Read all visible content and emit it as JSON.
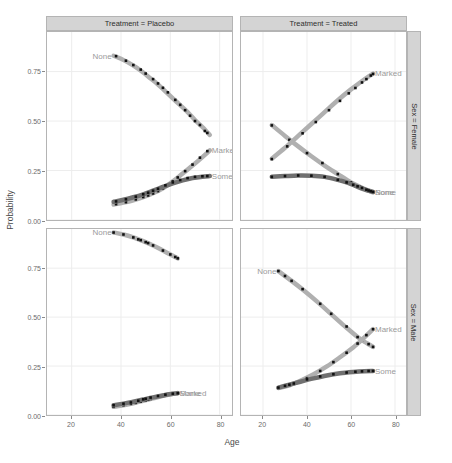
{
  "chart_data": {
    "type": "line",
    "title": "",
    "xlabel": "Age",
    "ylabel": "Probability",
    "xlim": [
      10,
      85
    ],
    "ylim": [
      0.0,
      0.95
    ],
    "grid": true,
    "legend_position": "inline-labels",
    "facet_rows": [
      "Sex = Female",
      "Sex = Male"
    ],
    "facet_cols": [
      "Treatment = Placebo",
      "Treatment = Treated"
    ],
    "xticks": [
      20,
      40,
      60,
      80
    ],
    "xtick_labels": [
      "20",
      "40",
      "60",
      "80"
    ],
    "yticks": [
      0.0,
      0.25,
      0.5,
      0.75
    ],
    "ytick_labels": [
      "0.00",
      "0.25",
      "0.50",
      "0.75"
    ],
    "colors": {
      "none": "#b0b0b0",
      "marked": "#b0b0b0",
      "some": "#707070",
      "point": "#111111",
      "panel_border": "#b4b4b4",
      "strip_fill": "#d4d4d4",
      "grid": "#ededed",
      "label_text": "#9a9a9a"
    },
    "panels": [
      {
        "id": "female-placebo",
        "col_label": "Treatment = Placebo",
        "row_label": "Sex = Female",
        "series": [
          {
            "name": "None",
            "color": "none",
            "label_anchor": "start",
            "x": [
              37,
              40,
              43,
              46,
              49,
              52,
              55,
              58,
              61,
              64,
              67,
              70,
              73,
              76
            ],
            "y": [
              0.83,
              0.815,
              0.795,
              0.772,
              0.745,
              0.715,
              0.685,
              0.65,
              0.615,
              0.58,
              0.545,
              0.505,
              0.47,
              0.43
            ],
            "points_x": [
              38,
              42,
              45,
              48,
              50,
              53,
              55,
              57,
              59,
              62,
              64,
              66,
              68,
              70,
              72,
              74,
              75
            ],
            "points_y": [
              0.828,
              0.805,
              0.783,
              0.76,
              0.74,
              0.712,
              0.69,
              0.668,
              0.645,
              0.607,
              0.582,
              0.555,
              0.527,
              0.5,
              0.48,
              0.45,
              0.44
            ]
          },
          {
            "name": "Marked",
            "color": "marked",
            "label_anchor": "end",
            "x": [
              37,
              41,
              45,
              49,
              53,
              57,
              61,
              65,
              69,
              73,
              76
            ],
            "y": [
              0.078,
              0.088,
              0.1,
              0.115,
              0.135,
              0.16,
              0.195,
              0.235,
              0.275,
              0.318,
              0.352
            ],
            "points_x": [
              38,
              42,
              46,
              49,
              51,
              53,
              55,
              57,
              59,
              61,
              63,
              66,
              69,
              72,
              75
            ],
            "points_y": [
              0.08,
              0.09,
              0.104,
              0.116,
              0.124,
              0.134,
              0.146,
              0.16,
              0.175,
              0.195,
              0.215,
              0.247,
              0.28,
              0.315,
              0.348
            ]
          },
          {
            "name": "Some",
            "color": "some",
            "label_anchor": "end",
            "x": [
              37,
              41,
              45,
              49,
              53,
              57,
              61,
              65,
              69,
              73,
              76
            ],
            "y": [
              0.092,
              0.102,
              0.115,
              0.13,
              0.148,
              0.167,
              0.185,
              0.2,
              0.212,
              0.219,
              0.222
            ],
            "points_x": [
              38,
              42,
              46,
              49,
              51,
              53,
              55,
              58,
              61,
              64,
              67,
              70,
              73,
              75
            ],
            "points_y": [
              0.094,
              0.105,
              0.118,
              0.13,
              0.138,
              0.148,
              0.158,
              0.175,
              0.19,
              0.202,
              0.212,
              0.218,
              0.221,
              0.222
            ]
          }
        ]
      },
      {
        "id": "female-treated",
        "col_label": "Treatment = Treated",
        "row_label": "Sex = Female",
        "series": [
          {
            "name": "None",
            "color": "none",
            "label_anchor": "end",
            "x": [
              24,
              30,
              36,
              42,
              48,
              54,
              60,
              64,
              68,
              70
            ],
            "y": [
              0.48,
              0.425,
              0.372,
              0.322,
              0.275,
              0.232,
              0.19,
              0.168,
              0.148,
              0.14
            ],
            "points_x": [
              24,
              32,
              40,
              47,
              54,
              60,
              64,
              66,
              68,
              69,
              70
            ],
            "points_y": [
              0.478,
              0.405,
              0.338,
              0.288,
              0.232,
              0.19,
              0.168,
              0.158,
              0.148,
              0.144,
              0.14
            ]
          },
          {
            "name": "Marked",
            "color": "marked",
            "label_anchor": "end",
            "x": [
              24,
              30,
              36,
              42,
              48,
              54,
              60,
              66,
              70
            ],
            "y": [
              0.31,
              0.365,
              0.425,
              0.485,
              0.545,
              0.605,
              0.66,
              0.71,
              0.74
            ],
            "points_x": [
              24,
              31,
              38,
              44,
              50,
              55,
              59,
              62,
              65,
              67,
              69,
              70
            ],
            "points_y": [
              0.308,
              0.372,
              0.438,
              0.495,
              0.555,
              0.602,
              0.64,
              0.667,
              0.695,
              0.712,
              0.73,
              0.738
            ]
          },
          {
            "name": "Some",
            "color": "some",
            "label_anchor": "end",
            "x": [
              24,
              30,
              36,
              42,
              48,
              54,
              58,
              62,
              66,
              70
            ],
            "y": [
              0.218,
              0.222,
              0.225,
              0.224,
              0.218,
              0.203,
              0.19,
              0.172,
              0.155,
              0.142
            ],
            "points_x": [
              24,
              30,
              36,
              42,
              48,
              54,
              58,
              61,
              63,
              65,
              67,
              68,
              69,
              70
            ],
            "points_y": [
              0.218,
              0.222,
              0.225,
              0.224,
              0.218,
              0.203,
              0.19,
              0.178,
              0.17,
              0.162,
              0.153,
              0.149,
              0.145,
              0.142
            ]
          }
        ]
      },
      {
        "id": "male-placebo",
        "col_label": "Treatment = Placebo",
        "row_label": "Sex = Male",
        "series": [
          {
            "name": "None",
            "color": "none",
            "label_anchor": "start",
            "x": [
              37,
              41,
              45,
              49,
              53,
              57,
              61,
              63
            ],
            "y": [
              0.932,
              0.922,
              0.907,
              0.888,
              0.866,
              0.84,
              0.813,
              0.8
            ],
            "points_x": [
              37,
              41,
              45,
              47,
              48,
              50,
              51,
              53,
              57,
              60,
              62,
              63
            ],
            "points_y": [
              0.932,
              0.922,
              0.907,
              0.897,
              0.893,
              0.883,
              0.878,
              0.866,
              0.84,
              0.82,
              0.807,
              0.8
            ]
          },
          {
            "name": "Marked",
            "color": "marked",
            "label_anchor": "end",
            "x": [
              37,
              41,
              45,
              49,
              53,
              57,
              61,
              63
            ],
            "y": [
              0.042,
              0.05,
              0.06,
              0.072,
              0.085,
              0.098,
              0.108,
              0.112
            ],
            "points_x": [
              37,
              41,
              44,
              46,
              48,
              50,
              51,
              52,
              54,
              57,
              60,
              62,
              63
            ],
            "points_y": [
              0.042,
              0.05,
              0.057,
              0.062,
              0.068,
              0.075,
              0.078,
              0.082,
              0.089,
              0.098,
              0.106,
              0.111,
              0.113
            ]
          },
          {
            "name": "Some",
            "color": "some",
            "label_anchor": "end",
            "x": [
              37,
              41,
              45,
              49,
              53,
              57,
              61,
              63
            ],
            "y": [
              0.05,
              0.058,
              0.068,
              0.079,
              0.09,
              0.1,
              0.108,
              0.111
            ],
            "points_x": [
              37,
              41,
              44,
              47,
              49,
              50,
              52,
              55,
              58,
              61,
              63
            ],
            "points_y": [
              0.05,
              0.058,
              0.064,
              0.073,
              0.08,
              0.083,
              0.089,
              0.097,
              0.104,
              0.109,
              0.111
            ]
          }
        ]
      },
      {
        "id": "male-treated",
        "col_label": "Treatment = Treated",
        "row_label": "Sex = Male",
        "series": [
          {
            "name": "None",
            "color": "none",
            "label_anchor": "start",
            "x": [
              27,
              33,
              39,
              45,
              51,
              57,
              63,
              67,
              70
            ],
            "y": [
              0.735,
              0.685,
              0.632,
              0.575,
              0.515,
              0.455,
              0.398,
              0.368,
              0.348
            ],
            "points_x": [
              27,
              30,
              33,
              38,
              46,
              51,
              58,
              63,
              65,
              68,
              70
            ],
            "points_y": [
              0.735,
              0.71,
              0.685,
              0.643,
              0.568,
              0.517,
              0.452,
              0.398,
              0.382,
              0.362,
              0.348
            ]
          },
          {
            "name": "Marked",
            "color": "marked",
            "label_anchor": "end",
            "x": [
              27,
              32,
              37,
              43,
              49,
              55,
              61,
              66,
              70
            ],
            "y": [
              0.138,
              0.152,
              0.175,
              0.208,
              0.248,
              0.295,
              0.345,
              0.395,
              0.438
            ],
            "points_x": [
              27,
              30,
              32,
              34,
              40,
              46,
              52,
              58,
              63,
              67,
              70
            ],
            "points_y": [
              0.138,
              0.146,
              0.152,
              0.159,
              0.188,
              0.225,
              0.27,
              0.318,
              0.365,
              0.408,
              0.438
            ]
          },
          {
            "name": "Some",
            "color": "some",
            "label_anchor": "end",
            "x": [
              27,
              32,
              37,
              43,
              49,
              55,
              61,
              66,
              70
            ],
            "y": [
              0.14,
              0.155,
              0.17,
              0.187,
              0.202,
              0.213,
              0.22,
              0.224,
              0.225
            ],
            "points_x": [
              27,
              30,
              32,
              34,
              40,
              46,
              52,
              58,
              62,
              65,
              68,
              70
            ],
            "points_y": [
              0.14,
              0.149,
              0.155,
              0.161,
              0.182,
              0.197,
              0.208,
              0.217,
              0.221,
              0.223,
              0.225,
              0.225
            ]
          }
        ]
      }
    ]
  }
}
